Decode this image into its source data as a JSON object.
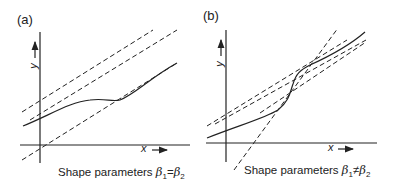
{
  "panels": [
    {
      "id": "a",
      "label": "(a)",
      "x_axis_label": "x",
      "y_axis_label": "y",
      "caption_prefix": "Shape parameters ",
      "beta": "β",
      "sub1": "1",
      "relation": "=",
      "sub2": "2"
    },
    {
      "id": "b",
      "label": "(b)",
      "x_axis_label": "x",
      "y_axis_label": "y",
      "caption_prefix": "Shape parameters ",
      "beta": "β",
      "sub1": "1",
      "relation": "≠",
      "sub2": "2"
    }
  ],
  "colors": {
    "ink": "#222222",
    "background": "#ffffff"
  }
}
